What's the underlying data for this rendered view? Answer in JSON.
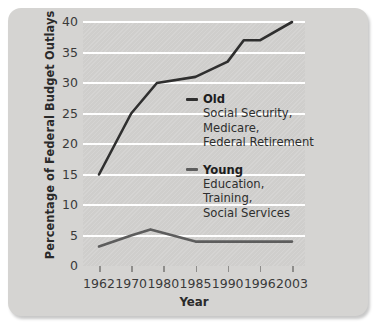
{
  "chart_data": {
    "type": "line",
    "title": "",
    "xlabel": "Year",
    "ylabel": "Percentage of Federal Budget Outlays",
    "xticklabels": [
      "1962",
      "1970",
      "1980",
      "1985",
      "1990",
      "1996",
      "2003"
    ],
    "yticklabels": [
      "0",
      "5",
      "10",
      "15",
      "20",
      "25",
      "30",
      "35",
      "40"
    ],
    "ylim": [
      0,
      40
    ],
    "ytick_values": [
      0,
      5,
      10,
      15,
      20,
      25,
      30,
      35,
      40
    ],
    "grid": "horizontal",
    "legend_position": "inside-right",
    "series": [
      {
        "name": "Old",
        "description_lines": [
          "Social Security,",
          "Medicare,",
          "Federal Retirement"
        ],
        "color": "#2f2f2f",
        "x": [
          "1962",
          "1970",
          "1978",
          "1985",
          "1990",
          "1993",
          "1996",
          "2003"
        ],
        "values": [
          15.0,
          25.0,
          30.0,
          31.0,
          33.5,
          37.0,
          37.0,
          40.0
        ]
      },
      {
        "name": "Young",
        "description_lines": [
          "Education,",
          "Training,",
          "Social Services"
        ],
        "color": "#5d5d5d",
        "x": [
          "1962",
          "1970",
          "1976",
          "1985",
          "1990",
          "1996",
          "2003"
        ],
        "values": [
          3.2,
          5.0,
          6.0,
          4.0,
          4.0,
          4.0,
          4.0
        ]
      }
    ]
  },
  "axes": {
    "y_title": "Percentage of Federal Budget Outlays",
    "x_title": "Year"
  },
  "colors": {
    "card_background": "#d5d4d2",
    "plot_background": "#cfcecc",
    "gridline": "#ffffff",
    "old_line": "#2f2f2f",
    "young_line": "#5d5d5d",
    "text": "#2a2a2a"
  }
}
